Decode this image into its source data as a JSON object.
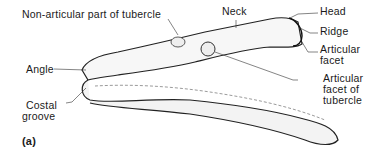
{
  "figure": {
    "panel_label": "(a)",
    "labels": {
      "non_articular": "Non-articular part of tubercle",
      "neck": "Neck",
      "head": "Head",
      "ridge": "Ridge",
      "articular_facet_1": "Articular",
      "articular_facet_2": "facet",
      "angle": "Angle",
      "costal_groove_1": "Costal",
      "costal_groove_2": "groove",
      "tubercle_facet_1": "Articular",
      "tubercle_facet_2": "facet of",
      "tubercle_facet_3": "tubercle"
    }
  }
}
